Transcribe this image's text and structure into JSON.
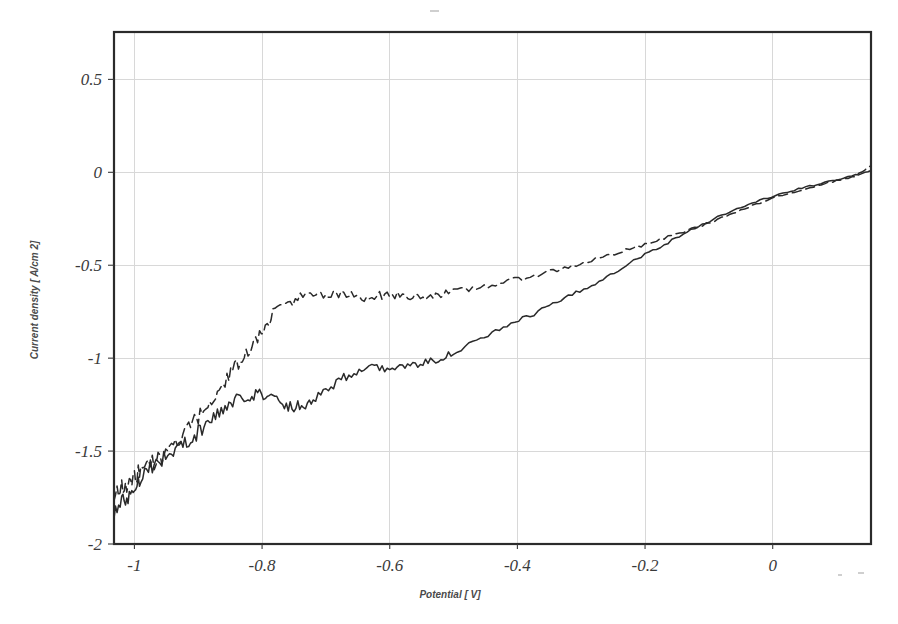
{
  "figure": {
    "background_color": "#ffffff",
    "frame_color": "#2b2b2b",
    "grid_color": "#d8d8d8",
    "curve_color": "#2a2a2a"
  },
  "axes": {
    "x_title": "Potential [ V]",
    "y_title": "Current density [ A/cm 2]",
    "x_tick_labels": [
      "-1",
      "-0.8",
      "-0.6",
      "-0.4",
      "-0.2",
      "0"
    ],
    "y_tick_labels": [
      "0.5",
      "0",
      "-0.5",
      "-1",
      "-1.5",
      "-2"
    ]
  },
  "chart_data": {
    "type": "line",
    "title": "",
    "xlabel": "Potential [ V]",
    "ylabel": "Current density [ A/cm 2]",
    "xlim": [
      -1.032,
      0.154
    ],
    "ylim": [
      -2.0,
      0.755
    ],
    "xticks": [
      -1,
      -0.8,
      -0.6,
      -0.4,
      -0.2,
      0
    ],
    "yticks": [
      0.5,
      0,
      -0.5,
      -1,
      -1.5,
      -2
    ],
    "grid": true,
    "legend": "none",
    "noise_amplitude": 0.022,
    "series": [
      {
        "name": "solid-curve",
        "style": "solid",
        "x": [
          -1.032,
          -1.02,
          -1.01,
          -1.0,
          -0.99,
          -0.975,
          -0.96,
          -0.945,
          -0.93,
          -0.915,
          -0.9,
          -0.885,
          -0.87,
          -0.855,
          -0.84,
          -0.825,
          -0.81,
          -0.795,
          -0.78,
          -0.765,
          -0.75,
          -0.735,
          -0.72,
          -0.7,
          -0.68,
          -0.66,
          -0.64,
          -0.62,
          -0.6,
          -0.58,
          -0.56,
          -0.54,
          -0.52,
          -0.5,
          -0.47,
          -0.44,
          -0.41,
          -0.38,
          -0.35,
          -0.32,
          -0.29,
          -0.26,
          -0.23,
          -0.2,
          -0.17,
          -0.14,
          -0.11,
          -0.08,
          -0.05,
          -0.02,
          0.01,
          0.04,
          0.07,
          0.1,
          0.13,
          0.154
        ],
        "y": [
          -1.83,
          -1.78,
          -1.74,
          -1.7,
          -1.63,
          -1.58,
          -1.55,
          -1.52,
          -1.48,
          -1.44,
          -1.4,
          -1.35,
          -1.3,
          -1.26,
          -1.23,
          -1.2,
          -1.19,
          -1.2,
          -1.22,
          -1.25,
          -1.26,
          -1.25,
          -1.22,
          -1.17,
          -1.12,
          -1.08,
          -1.06,
          -1.055,
          -1.05,
          -1.045,
          -1.04,
          -1.02,
          -1.0,
          -0.97,
          -0.92,
          -0.87,
          -0.82,
          -0.77,
          -0.72,
          -0.67,
          -0.62,
          -0.56,
          -0.5,
          -0.44,
          -0.39,
          -0.33,
          -0.28,
          -0.23,
          -0.19,
          -0.15,
          -0.12,
          -0.09,
          -0.065,
          -0.04,
          -0.015,
          0.01
        ]
      },
      {
        "name": "dashed-curve",
        "style": "dashed",
        "x": [
          -1.032,
          -1.02,
          -1.01,
          -1.0,
          -0.99,
          -0.975,
          -0.96,
          -0.945,
          -0.93,
          -0.915,
          -0.9,
          -0.885,
          -0.87,
          -0.855,
          -0.84,
          -0.825,
          -0.81,
          -0.795,
          -0.78,
          -0.76,
          -0.74,
          -0.72,
          -0.7,
          -0.68,
          -0.66,
          -0.64,
          -0.62,
          -0.6,
          -0.58,
          -0.56,
          -0.54,
          -0.52,
          -0.5,
          -0.47,
          -0.44,
          -0.41,
          -0.38,
          -0.35,
          -0.32,
          -0.29,
          -0.26,
          -0.23,
          -0.2,
          -0.17,
          -0.14,
          -0.11,
          -0.08,
          -0.05,
          -0.02,
          0.01,
          0.04,
          0.07,
          0.1,
          0.13,
          0.154
        ],
        "y": [
          -1.73,
          -1.7,
          -1.67,
          -1.64,
          -1.6,
          -1.57,
          -1.54,
          -1.49,
          -1.44,
          -1.38,
          -1.32,
          -1.25,
          -1.18,
          -1.11,
          -1.04,
          -0.97,
          -0.9,
          -0.83,
          -0.74,
          -0.7,
          -0.675,
          -0.665,
          -0.665,
          -0.66,
          -0.665,
          -0.67,
          -0.665,
          -0.66,
          -0.665,
          -0.67,
          -0.665,
          -0.655,
          -0.645,
          -0.625,
          -0.605,
          -0.585,
          -0.56,
          -0.535,
          -0.51,
          -0.48,
          -0.45,
          -0.42,
          -0.39,
          -0.355,
          -0.32,
          -0.285,
          -0.245,
          -0.205,
          -0.165,
          -0.13,
          -0.1,
          -0.07,
          -0.045,
          -0.02,
          0.035
        ]
      }
    ]
  }
}
